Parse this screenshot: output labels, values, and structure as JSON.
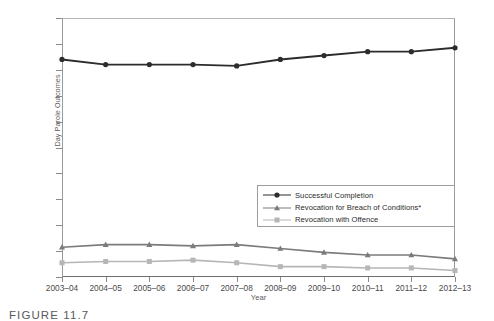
{
  "figure": {
    "caption": "FIGURE 11.7"
  },
  "chart_data": {
    "type": "line",
    "title": "",
    "xlabel": "Year",
    "ylabel": "Day Parole Outcomes",
    "categories": [
      "2003–04",
      "2004–05",
      "2005–06",
      "2006–07",
      "2007–08",
      "2008–09",
      "2009–10",
      "2010–11",
      "2011–12",
      "2012–13"
    ],
    "ylim": [
      0,
      100
    ],
    "ytick_labels": [
      "0%",
      "10%",
      "20%",
      "30%",
      "40%",
      "50%",
      "60%",
      "70%",
      "80%",
      "90%",
      "100%"
    ],
    "ytick_values": [
      0,
      10,
      20,
      30,
      40,
      50,
      60,
      70,
      80,
      90,
      100
    ],
    "grid": false,
    "legend_position": "inside-right",
    "series": [
      {
        "name": "Successful Completion",
        "marker": "circle",
        "color": "#2c2c2c",
        "values": [
          84,
          82,
          82,
          82,
          81.5,
          84,
          85.5,
          87,
          87,
          88.5
        ]
      },
      {
        "name": "Revocation for Breach of Conditions*",
        "marker": "triangle",
        "color": "#7b7b7b",
        "values": [
          11.5,
          12.5,
          12.5,
          12,
          12.5,
          11,
          9.5,
          8.5,
          8.5,
          7
        ]
      },
      {
        "name": "Revocation with Offence",
        "marker": "square",
        "color": "#b6b6b6",
        "values": [
          5.5,
          6,
          6,
          6.5,
          5.5,
          4,
          4,
          3.5,
          3.5,
          2.5
        ]
      }
    ]
  }
}
